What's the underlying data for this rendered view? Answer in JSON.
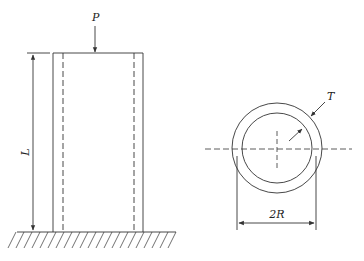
{
  "diagram": {
    "column_view": {
      "load_label": "P",
      "length_label": "L"
    },
    "cross_section": {
      "thickness_label": "T",
      "diameter_label": "2R"
    },
    "colors": {
      "line": "#333333",
      "background": "#ffffff"
    }
  }
}
